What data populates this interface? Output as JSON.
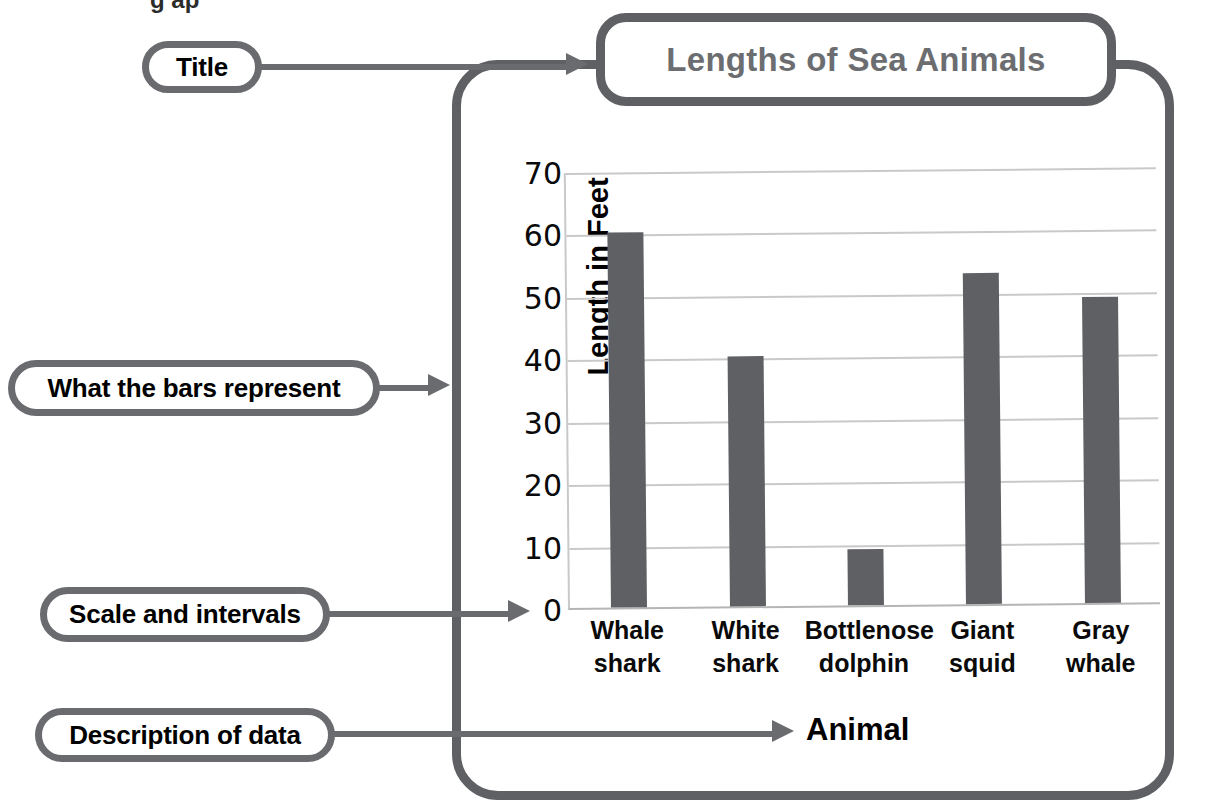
{
  "page": {
    "top_fragment": "g  ap"
  },
  "title_box": {
    "text": "Lengths of Sea Animals",
    "color": "#6c6d70"
  },
  "callouts": [
    {
      "id": "title",
      "label": "Title"
    },
    {
      "id": "bars",
      "label": "What the bars represent"
    },
    {
      "id": "scale",
      "label": "Scale and intervals"
    },
    {
      "id": "description",
      "label": "Description of data"
    }
  ],
  "colors": {
    "frame": "#5f6063",
    "bar": "#5f6063",
    "gridline": "#c9c9c9",
    "callout_border": "#6a6b6e",
    "title_text": "#6c6d70",
    "label_text": "#000000"
  },
  "chart_data": {
    "type": "bar",
    "title": "Lengths of Sea Animals",
    "xlabel": "Animal",
    "ylabel": "Length in Feet",
    "categories": [
      "Whale shark",
      "White shark",
      "Bottlenose dolphin",
      "Giant squid",
      "Gray whale"
    ],
    "category_lines": [
      [
        "Whale",
        "shark"
      ],
      [
        "White",
        "shark"
      ],
      [
        "Bottlenose",
        "dolphin"
      ],
      [
        "Giant",
        "squid"
      ],
      [
        "Gray",
        "whale"
      ]
    ],
    "values": [
      60,
      40,
      9,
      53,
      49
    ],
    "ylim": [
      0,
      70
    ],
    "yticks": [
      0,
      10,
      20,
      30,
      40,
      50,
      60,
      70
    ],
    "ytick_labels": [
      "0",
      "10",
      "20",
      "30",
      "40",
      "50",
      "60",
      "70"
    ],
    "grid": true,
    "legend": null,
    "bar_color": "#5f6063"
  }
}
